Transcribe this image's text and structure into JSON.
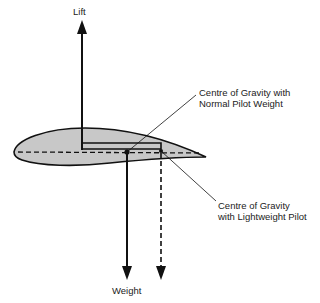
{
  "diagram": {
    "labels": {
      "lift": "Lift",
      "weight": "Weight",
      "cg_normal_line1": "Centre of Gravity with",
      "cg_normal_line2": "Normal Pilot Weight",
      "cg_light_line1": "Centre of Gravity",
      "cg_light_line2": "with Lightweight Pilot"
    },
    "colors": {
      "wing_fill": "#c8c8c8",
      "stroke": "#111111",
      "text": "#222222",
      "background": "#ffffff"
    }
  }
}
